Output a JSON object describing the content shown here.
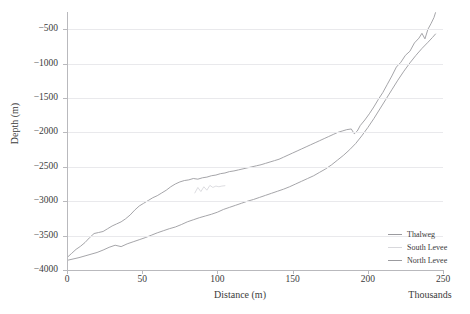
{
  "chart_data": {
    "type": "line",
    "title": "",
    "xlabel": "Distance (m)",
    "ylabel": "Depth (m)",
    "x_units_note": "Thousands",
    "xlim": [
      0,
      250
    ],
    "ylim": [
      -4000,
      -250
    ],
    "xticks": [
      0,
      50,
      100,
      150,
      200,
      250
    ],
    "xtick_labels": [
      "0",
      "50",
      "100",
      "150",
      "200",
      "250"
    ],
    "yticks": [
      -500,
      -1000,
      -1500,
      -2000,
      -2500,
      -3000,
      -3500,
      -4000
    ],
    "ytick_labels": [
      "−500",
      "−1000",
      "−1500",
      "−2000",
      "−2500",
      "−3000",
      "−3500",
      "−4000"
    ],
    "grid": true,
    "legend_position": "right-inside-lower",
    "series": [
      {
        "name": "Thalweg",
        "color": "#9b9b9f",
        "x": [
          0,
          3,
          6,
          9,
          12,
          15,
          18,
          21,
          24,
          27,
          30,
          33,
          36,
          39,
          42,
          45,
          48,
          51,
          54,
          57,
          60,
          63,
          66,
          69,
          72,
          75,
          78,
          81,
          84,
          87,
          90,
          93,
          96,
          99,
          102,
          105,
          108,
          111,
          114,
          117,
          120,
          123,
          126,
          129,
          132,
          135,
          138,
          141,
          144,
          147,
          150,
          153,
          156,
          159,
          162,
          165,
          168,
          171,
          174,
          177,
          180,
          183,
          186,
          189,
          191,
          193,
          195,
          198,
          201,
          204,
          207,
          210,
          213,
          216,
          219,
          222,
          225,
          228,
          231,
          234,
          236,
          238,
          240,
          242,
          244,
          245
        ],
        "y": [
          -3820,
          -3760,
          -3700,
          -3655,
          -3600,
          -3530,
          -3470,
          -3455,
          -3440,
          -3400,
          -3360,
          -3330,
          -3300,
          -3255,
          -3200,
          -3130,
          -3070,
          -3030,
          -2990,
          -2950,
          -2920,
          -2880,
          -2840,
          -2790,
          -2750,
          -2720,
          -2700,
          -2690,
          -2670,
          -2680,
          -2660,
          -2650,
          -2630,
          -2620,
          -2600,
          -2590,
          -2570,
          -2560,
          -2545,
          -2530,
          -2515,
          -2500,
          -2485,
          -2470,
          -2450,
          -2430,
          -2410,
          -2390,
          -2360,
          -2330,
          -2300,
          -2270,
          -2240,
          -2210,
          -2180,
          -2150,
          -2120,
          -2090,
          -2060,
          -2030,
          -2000,
          -1980,
          -1960,
          -1950,
          -2020,
          -1980,
          -1900,
          -1820,
          -1730,
          -1630,
          -1520,
          -1420,
          -1300,
          -1180,
          -1050,
          -980,
          -880,
          -820,
          -700,
          -630,
          -560,
          -640,
          -500,
          -420,
          -330,
          -260
        ]
      },
      {
        "name": "South Levee",
        "color": "#d8d8dc",
        "x": [
          85,
          87,
          89,
          91,
          93,
          95,
          97,
          99,
          101,
          103,
          105
        ],
        "y": [
          -2880,
          -2800,
          -2860,
          -2790,
          -2840,
          -2770,
          -2800,
          -2780,
          -2790,
          -2780,
          -2775
        ]
      },
      {
        "name": "North Levee",
        "color": "#9b9b9f",
        "x": [
          0,
          4,
          8,
          12,
          16,
          20,
          24,
          28,
          32,
          36,
          40,
          44,
          48,
          52,
          56,
          60,
          64,
          68,
          72,
          76,
          80,
          84,
          88,
          92,
          96,
          100,
          104,
          108,
          112,
          116,
          120,
          124,
          128,
          132,
          136,
          140,
          144,
          148,
          152,
          156,
          160,
          164,
          168,
          172,
          176,
          180,
          184,
          188,
          192,
          196,
          200,
          204,
          208,
          212,
          216,
          220,
          224,
          228,
          232,
          236,
          240,
          243,
          245
        ],
        "y": [
          -3860,
          -3840,
          -3820,
          -3795,
          -3770,
          -3745,
          -3710,
          -3670,
          -3640,
          -3660,
          -3620,
          -3590,
          -3560,
          -3530,
          -3495,
          -3460,
          -3430,
          -3400,
          -3375,
          -3340,
          -3300,
          -3270,
          -3240,
          -3215,
          -3190,
          -3160,
          -3120,
          -3090,
          -3060,
          -3030,
          -3000,
          -2975,
          -2945,
          -2915,
          -2885,
          -2855,
          -2825,
          -2790,
          -2750,
          -2710,
          -2670,
          -2630,
          -2580,
          -2530,
          -2470,
          -2400,
          -2330,
          -2250,
          -2160,
          -2050,
          -1930,
          -1800,
          -1660,
          -1520,
          -1380,
          -1240,
          -1110,
          -990,
          -880,
          -780,
          -690,
          -620,
          -570
        ]
      }
    ]
  },
  "legend": {
    "items": [
      {
        "label": "Thalweg"
      },
      {
        "label": "South Levee"
      },
      {
        "label": "North Levee"
      }
    ]
  }
}
